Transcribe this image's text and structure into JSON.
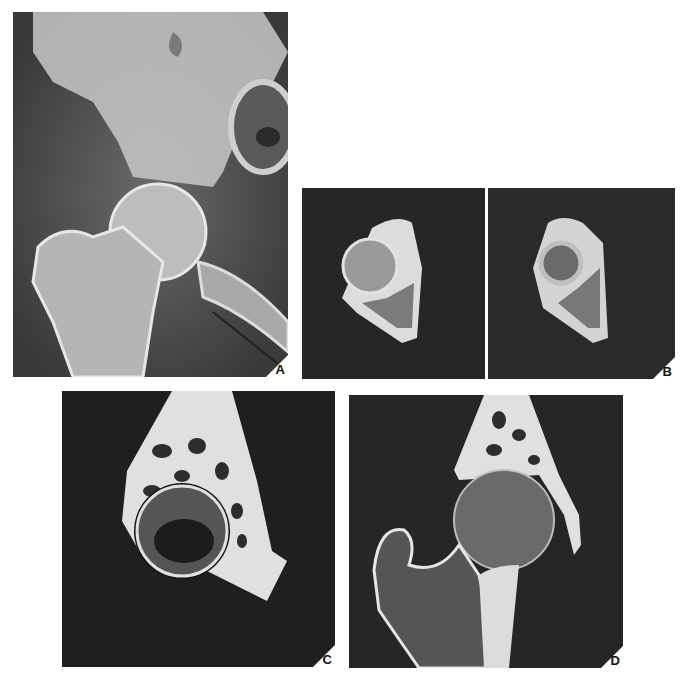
{
  "figure": {
    "panels": [
      {
        "id": "A",
        "label": "A",
        "modality": "radiograph",
        "view": "AP hip",
        "colors": {
          "background": "#5a5a5a",
          "bone": "#d8d8d8"
        }
      },
      {
        "id": "B",
        "label": "B",
        "modality": "CT",
        "view": "axial",
        "subpanels": 2,
        "colors": {
          "background": "#262626",
          "bone": "#e0e0e0"
        }
      },
      {
        "id": "C",
        "label": "C",
        "modality": "CT",
        "view": "sagittal",
        "colors": {
          "background": "#1f1f1f",
          "bone": "#e6e6e6"
        }
      },
      {
        "id": "D",
        "label": "D",
        "modality": "CT",
        "view": "coronal",
        "colors": {
          "background": "#262626",
          "bone": "#e6e6e6"
        }
      }
    ]
  }
}
